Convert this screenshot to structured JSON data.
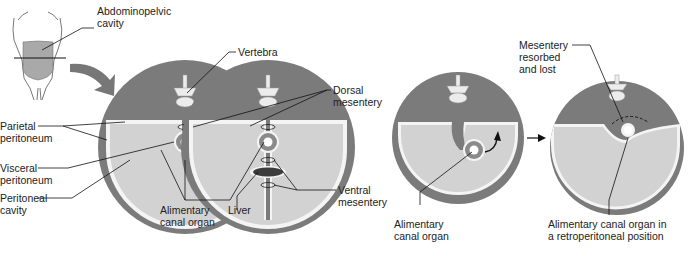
{
  "diagram": {
    "colors": {
      "wall": "#7b7b7b",
      "cavity": "#d2d2d2",
      "membrane": "#f4f4f4",
      "organ_ring": "#8a8a8a",
      "liver": "#3c3c3c",
      "bone": "#ececec",
      "line": "#111111",
      "body_fill": "#a9a9a9"
    },
    "labels": {
      "abdominopelvic_cavity": "Abdominopelvic\ncavity",
      "vertebra": "Vertebra",
      "dorsal_mesentery": "Dorsal\nmesentery",
      "parietal_peritoneum": "Parietal\nperitoneum",
      "visceral_peritoneum": "Visceral\nperitoneum",
      "peritoneal_cavity": "Peritoneal\ncavity",
      "alimentary_canal_organ_1": "Alimentary\ncanal organ",
      "liver": "Liver",
      "ventral_mesentery": "Ventral\nmesentery",
      "alimentary_canal_organ_2": "Alimentary\ncanal organ",
      "mesentery_resorbed": "Mesentery\nresorbed\nand lost",
      "retroperitoneal": "Alimentary canal organ in\na retroperitoneal position"
    }
  }
}
